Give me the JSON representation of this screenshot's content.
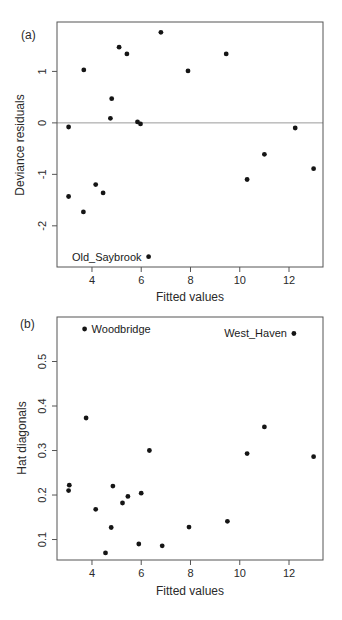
{
  "figure_title": "",
  "colors": {
    "point": "#151515",
    "frame": "#555555",
    "zero_line": "#9a9a9a",
    "background": "#ffffff"
  },
  "chart_data": [
    {
      "type": "scatter",
      "panel_tag": "(a)",
      "xlabel": "Fitted values",
      "ylabel": "Deviance residuals",
      "xlim": [
        2.58,
        13.38
      ],
      "ylim": [
        -2.8,
        1.96
      ],
      "xticks": [
        4,
        6,
        8,
        10,
        12
      ],
      "yticks": [
        -2,
        -1,
        0,
        1
      ],
      "grid": false,
      "hline": 0,
      "points": [
        [
          3.05,
          -0.08
        ],
        [
          3.05,
          -1.43
        ],
        [
          3.67,
          1.03
        ],
        [
          3.65,
          -1.73
        ],
        [
          4.15,
          -1.2
        ],
        [
          4.45,
          -1.36
        ],
        [
          4.8,
          0.47
        ],
        [
          4.75,
          0.09
        ],
        [
          5.1,
          1.47
        ],
        [
          5.42,
          1.34
        ],
        [
          5.85,
          0.02
        ],
        [
          5.97,
          -0.02
        ],
        [
          6.3,
          -2.6
        ],
        [
          6.8,
          1.76
        ],
        [
          7.9,
          1.01
        ],
        [
          9.45,
          1.34
        ],
        [
          10.3,
          -1.1
        ],
        [
          11.0,
          -0.61
        ],
        [
          12.25,
          -0.1
        ],
        [
          13.0,
          -0.89
        ]
      ],
      "annotations": [
        {
          "label": "Old_Saybrook",
          "x": 6.3,
          "y": -2.6,
          "side": "left"
        }
      ]
    },
    {
      "type": "scatter",
      "panel_tag": "(b)",
      "xlabel": "Fitted values",
      "ylabel": "Hat diagonals",
      "xlim": [
        2.58,
        13.38
      ],
      "ylim": [
        0.054,
        0.6
      ],
      "xticks": [
        4,
        6,
        8,
        10,
        12
      ],
      "yticks": [
        0.1,
        0.2,
        0.3,
        0.4,
        0.5
      ],
      "grid": false,
      "hline": null,
      "points": [
        [
          3.05,
          0.21
        ],
        [
          3.08,
          0.222
        ],
        [
          3.7,
          0.573
        ],
        [
          3.76,
          0.373
        ],
        [
          4.15,
          0.168
        ],
        [
          4.55,
          0.07
        ],
        [
          4.85,
          0.22
        ],
        [
          4.78,
          0.127
        ],
        [
          5.24,
          0.182
        ],
        [
          5.46,
          0.197
        ],
        [
          5.9,
          0.09
        ],
        [
          6.0,
          0.204
        ],
        [
          6.33,
          0.3
        ],
        [
          6.85,
          0.086
        ],
        [
          7.94,
          0.128
        ],
        [
          9.5,
          0.141
        ],
        [
          10.3,
          0.293
        ],
        [
          11.0,
          0.353
        ],
        [
          12.2,
          0.563
        ],
        [
          13.0,
          0.286
        ]
      ],
      "annotations": [
        {
          "label": "Woodbridge",
          "x": 3.7,
          "y": 0.573,
          "side": "right"
        },
        {
          "label": "West_Haven",
          "x": 12.2,
          "y": 0.563,
          "side": "left"
        }
      ]
    }
  ]
}
